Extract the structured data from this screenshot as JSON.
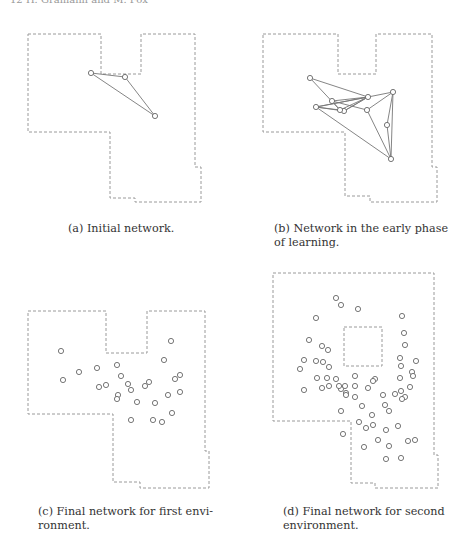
{
  "header": {
    "text": "12    H. Gramann and M. Fox"
  },
  "figure": {
    "panels": [
      {
        "id": "a",
        "caption": "(a) Initial network.",
        "environment": "first",
        "nodes": [
          [
            91,
            73
          ],
          [
            125,
            77
          ],
          [
            155,
            116
          ]
        ],
        "edges": [
          [
            0,
            1
          ],
          [
            1,
            2
          ],
          [
            0,
            2
          ]
        ]
      },
      {
        "id": "b",
        "caption_line1": "(b) Network in the early phase",
        "caption_line2": "of learning.",
        "environment": "first",
        "nodes": [
          [
            310,
            78
          ],
          [
            332,
            101
          ],
          [
            368,
            97
          ],
          [
            344,
            111
          ],
          [
            316,
            107
          ],
          [
            340,
            110
          ],
          [
            367,
            110
          ],
          [
            393,
            92
          ],
          [
            387,
            125
          ],
          [
            391,
            159
          ]
        ],
        "edges": [
          [
            0,
            2
          ],
          [
            0,
            5
          ],
          [
            1,
            2
          ],
          [
            1,
            6
          ],
          [
            2,
            3
          ],
          [
            2,
            7
          ],
          [
            2,
            4
          ],
          [
            2,
            5
          ],
          [
            3,
            4
          ],
          [
            4,
            5
          ],
          [
            4,
            2
          ],
          [
            4,
            9
          ],
          [
            6,
            7
          ],
          [
            6,
            9
          ],
          [
            7,
            9
          ],
          [
            7,
            8
          ],
          [
            8,
            9
          ],
          [
            1,
            5
          ],
          [
            3,
            2
          ]
        ]
      },
      {
        "id": "c",
        "caption_line1": "(c) Final network for first envi-",
        "caption_line2": "ronment.",
        "environment": "first",
        "nodes": [
          [
            61,
            351
          ],
          [
            79,
            372
          ],
          [
            63,
            380
          ],
          [
            97,
            368
          ],
          [
            117,
            365
          ],
          [
            106,
            385
          ],
          [
            121,
            376
          ],
          [
            118,
            395
          ],
          [
            99,
            387
          ],
          [
            128,
            384
          ],
          [
            117,
            399
          ],
          [
            131,
            390
          ],
          [
            145,
            386
          ],
          [
            149,
            382
          ],
          [
            168,
            395
          ],
          [
            175,
            379
          ],
          [
            172,
            413
          ],
          [
            162,
            422
          ],
          [
            155,
            403
          ],
          [
            137,
            402
          ],
          [
            164,
            360
          ],
          [
            171,
            341
          ],
          [
            180,
            375
          ],
          [
            180,
            392
          ],
          [
            131,
            420
          ],
          [
            153,
            420
          ]
        ]
      },
      {
        "id": "d",
        "caption_line1": "(d) Final network for second",
        "caption_line2": "environment.",
        "environment": "second",
        "nodes": [
          [
            336,
            298
          ],
          [
            341,
            305
          ],
          [
            358,
            309
          ],
          [
            316,
            318
          ],
          [
            402,
            316
          ],
          [
            404,
            333
          ],
          [
            405,
            345
          ],
          [
            309,
            340
          ],
          [
            322,
            346
          ],
          [
            328,
            350
          ],
          [
            304,
            360
          ],
          [
            316,
            361
          ],
          [
            323,
            362
          ],
          [
            329,
            367
          ],
          [
            300,
            369
          ],
          [
            400,
            358
          ],
          [
            401,
            366
          ],
          [
            416,
            361
          ],
          [
            412,
            372
          ],
          [
            413,
            376
          ],
          [
            317,
            378
          ],
          [
            327,
            378
          ],
          [
            336,
            379
          ],
          [
            355,
            376
          ],
          [
            375,
            379
          ],
          [
            400,
            378
          ],
          [
            322,
            388
          ],
          [
            329,
            386
          ],
          [
            341,
            389
          ],
          [
            339,
            386
          ],
          [
            345,
            386
          ],
          [
            355,
            386
          ],
          [
            373,
            381
          ],
          [
            410,
            387
          ],
          [
            304,
            390
          ],
          [
            346,
            393
          ],
          [
            346,
            395
          ],
          [
            355,
            397
          ],
          [
            368,
            388
          ],
          [
            401,
            391
          ],
          [
            405,
            397
          ],
          [
            383,
            395
          ],
          [
            395,
            394
          ],
          [
            402,
            399
          ],
          [
            362,
            406
          ],
          [
            385,
            405
          ],
          [
            341,
            411
          ],
          [
            372,
            415
          ],
          [
            389,
            411
          ],
          [
            373,
            425
          ],
          [
            359,
            422
          ],
          [
            366,
            428
          ],
          [
            343,
            434
          ],
          [
            386,
            430
          ],
          [
            398,
            426
          ],
          [
            378,
            440
          ],
          [
            389,
            446
          ],
          [
            408,
            441
          ],
          [
            364,
            447
          ],
          [
            415,
            440
          ],
          [
            386,
            459
          ],
          [
            401,
            458
          ]
        ]
      }
    ]
  }
}
